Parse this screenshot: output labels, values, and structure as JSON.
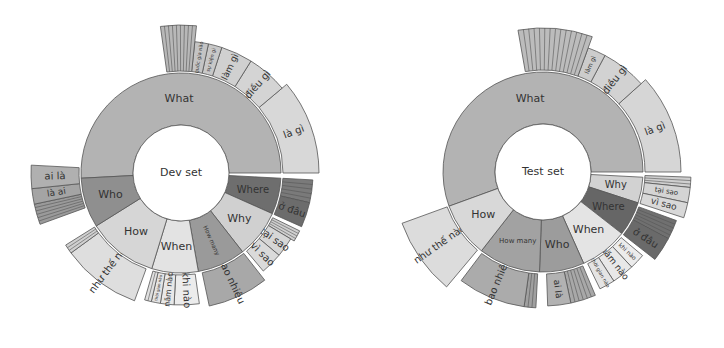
{
  "chart_data": [
    {
      "type": "sunburst",
      "title": "Dev set",
      "center": [
        181,
        173
      ],
      "radii": {
        "inner": 48,
        "middle": 100,
        "outer_default": 136
      },
      "inner_ring": [
        {
          "label": "What",
          "start": -183,
          "end": 0,
          "color": "#b3b3b3",
          "font": 11
        },
        {
          "label": "Where",
          "start": 3,
          "end": 24,
          "color": "#6e6e6e",
          "font": 10
        },
        {
          "label": "Why",
          "start": 24,
          "end": 52,
          "color": "#d0d0d0",
          "font": 11
        },
        {
          "label": "How many",
          "start": 52,
          "end": 80,
          "color": "#9a9a9a",
          "font": 6,
          "rotate_text": true
        },
        {
          "label": "When",
          "start": 80,
          "end": 107,
          "color": "#e3e3e3",
          "font": 11
        },
        {
          "label": "How",
          "start": 107,
          "end": 148,
          "color": "#d6d6d6",
          "font": 11
        },
        {
          "label": "Who",
          "start": 148,
          "end": 177,
          "color": "#8f8f8f",
          "font": 11
        }
      ],
      "outer_ring": [
        {
          "label": "là gì",
          "start": -40,
          "end": 0,
          "color": "#d8d8d8",
          "r": 138,
          "font": 10
        },
        {
          "label": "điều gì",
          "start": -58,
          "end": -40,
          "color": "#d4d4d4",
          "r": 132,
          "font": 10
        },
        {
          "label": "làm gì",
          "start": -72,
          "end": -58,
          "color": "#d0d0d0",
          "r": 132,
          "font": 9
        },
        {
          "label": "sự kiện gì",
          "start": -78,
          "end": -72,
          "color": "#c8c8c8",
          "r": 132,
          "font": 5
        },
        {
          "label": "quốc gia nào",
          "start": -84,
          "end": -78,
          "color": "#c4c4c4",
          "r": 132,
          "font": 5
        },
        {
          "label": "",
          "start": -98,
          "end": -84,
          "color": "#b8b8b8",
          "r": 148,
          "font": 4,
          "striped": 9
        },
        {
          "label": "",
          "start": 3,
          "end": 13,
          "color": "#7a7a7a",
          "r": 132,
          "font": 4,
          "striped": 5
        },
        {
          "label": "ở đâu",
          "start": 13,
          "end": 24,
          "color": "#6c6c6c",
          "r": 132,
          "font": 10
        },
        {
          "label": "",
          "start": 26,
          "end": 31,
          "color": "#cfcfcf",
          "r": 132,
          "font": 4,
          "striped": 4
        },
        {
          "label": "tại sao",
          "start": 31,
          "end": 40,
          "color": "#d6d6d6",
          "r": 128,
          "font": 10
        },
        {
          "label": "vì sao",
          "start": 40,
          "end": 50,
          "color": "#dadada",
          "r": 128,
          "font": 10
        },
        {
          "label": "bao nhiêu",
          "start": 52,
          "end": 78,
          "color": "#a8a8a8",
          "r": 136,
          "font": 10
        },
        {
          "label": "khi nào",
          "start": 82,
          "end": 93,
          "color": "#ececec",
          "r": 132,
          "font": 10
        },
        {
          "label": "năm nào",
          "start": 93,
          "end": 99,
          "color": "#e8e8e8",
          "r": 132,
          "font": 8
        },
        {
          "label": "thời gian nào",
          "start": 99,
          "end": 103,
          "color": "#e4e4e4",
          "r": 132,
          "font": 4
        },
        {
          "label": "",
          "start": 103,
          "end": 106,
          "color": "#e0e0e0",
          "r": 132,
          "font": 4,
          "striped": 2
        },
        {
          "label": "như thế nào",
          "start": 110,
          "end": 144,
          "color": "#dedede",
          "r": 136,
          "font": 10
        },
        {
          "label": "",
          "start": 144,
          "end": 148,
          "color": "#d0d0d0",
          "r": 136,
          "font": 4,
          "striped": 3
        },
        {
          "label": "",
          "start": 160,
          "end": 168,
          "color": "#9a9a9a",
          "r": 150,
          "font": 4,
          "striped": 6
        },
        {
          "label": "là ai",
          "start": 168,
          "end": 174,
          "color": "#a4a4a4",
          "r": 150,
          "font": 9
        },
        {
          "label": "ai là",
          "start": 174,
          "end": 183,
          "color": "#b0b0b0",
          "r": 150,
          "font": 10
        }
      ]
    },
    {
      "type": "sunburst",
      "title": "Test set",
      "center": [
        543,
        172
      ],
      "radii": {
        "inner": 48,
        "middle": 100,
        "outer_default": 136
      },
      "inner_ring": [
        {
          "label": "What",
          "start": -200,
          "end": 0,
          "color": "#b3b3b3",
          "font": 11
        },
        {
          "label": "Why",
          "start": 3,
          "end": 18,
          "color": "#d2d2d2",
          "font": 10
        },
        {
          "label": "Where",
          "start": 18,
          "end": 38,
          "color": "#666666",
          "font": 10
        },
        {
          "label": "When",
          "start": 38,
          "end": 66,
          "color": "#e4e4e4",
          "font": 11
        },
        {
          "label": "Who",
          "start": 66,
          "end": 92,
          "color": "#9c9c9c",
          "font": 11
        },
        {
          "label": "How many",
          "start": 92,
          "end": 128,
          "color": "#a2a2a2",
          "font": 7
        },
        {
          "label": "How",
          "start": 128,
          "end": 160,
          "color": "#d8d8d8",
          "font": 11
        }
      ],
      "outer_ring": [
        {
          "label": "là gì",
          "start": -42,
          "end": 0,
          "color": "#d6d6d6",
          "r": 138,
          "font": 10
        },
        {
          "label": "điều gì",
          "start": -62,
          "end": -42,
          "color": "#d2d2d2",
          "r": 132,
          "font": 10
        },
        {
          "label": "làm gì",
          "start": -70,
          "end": -62,
          "color": "#cccccc",
          "r": 132,
          "font": 6
        },
        {
          "label": "",
          "start": -100,
          "end": -70,
          "color": "#bcbcbc",
          "r": 144,
          "font": 4,
          "striped": 14
        },
        {
          "label": "",
          "start": 2,
          "end": 6,
          "color": "#cfcfcf",
          "r": 148,
          "font": 4,
          "striped": 3
        },
        {
          "label": "tại sao",
          "start": 6,
          "end": 12,
          "color": "#d4d4d4",
          "r": 148,
          "font": 7
        },
        {
          "label": "vì sao",
          "start": 12,
          "end": 18,
          "color": "#d8d8d8",
          "r": 148,
          "font": 9
        },
        {
          "label": "",
          "start": 20,
          "end": 28,
          "color": "#707070",
          "r": 142,
          "font": 4,
          "striped": 5
        },
        {
          "label": "ở đâu",
          "start": 28,
          "end": 38,
          "color": "#6a6a6a",
          "r": 142,
          "font": 10
        },
        {
          "label": "khi nào",
          "start": 40,
          "end": 47,
          "color": "#ececec",
          "r": 130,
          "font": 6
        },
        {
          "label": "năm nào",
          "start": 47,
          "end": 57,
          "color": "#e8e8e8",
          "r": 130,
          "font": 9
        },
        {
          "label": "thời gian nào",
          "start": 57,
          "end": 64,
          "color": "#e4e4e4",
          "r": 130,
          "font": 5
        },
        {
          "label": "",
          "start": 67,
          "end": 78,
          "color": "#a8a8a8",
          "r": 134,
          "font": 4,
          "striped": 6
        },
        {
          "label": "ai là",
          "start": 78,
          "end": 88,
          "color": "#b2b2b2",
          "r": 134,
          "font": 9
        },
        {
          "label": "",
          "start": 93,
          "end": 98,
          "color": "#a0a0a0",
          "r": 136,
          "font": 4,
          "striped": 3
        },
        {
          "label": "bao nhiêu",
          "start": 98,
          "end": 127,
          "color": "#ababab",
          "r": 136,
          "font": 10
        },
        {
          "label": "như thế nào",
          "start": 130,
          "end": 160,
          "color": "#dcdcdc",
          "r": 150,
          "font": 10
        }
      ]
    }
  ]
}
